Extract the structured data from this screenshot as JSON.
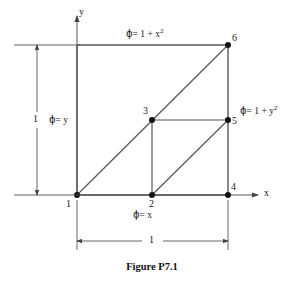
{
  "figure": {
    "caption": "Figure P7.1",
    "axes": {
      "x_label": "x",
      "y_label": "y"
    },
    "nodes": [
      {
        "id": "1",
        "label": "1",
        "x": 0.0,
        "y": 0.0
      },
      {
        "id": "2",
        "label": "2",
        "x": 0.5,
        "y": 0.0
      },
      {
        "id": "3",
        "label": "3",
        "x": 0.5,
        "y": 0.5
      },
      {
        "id": "4",
        "label": "4",
        "x": 1.0,
        "y": 0.0
      },
      {
        "id": "5",
        "label": "5",
        "x": 1.0,
        "y": 0.5
      },
      {
        "id": "6",
        "label": "6",
        "x": 1.0,
        "y": 1.0
      }
    ],
    "boundary_conditions": [
      {
        "name": "top",
        "glyph": "ϕ",
        "equation": "= 1 + x",
        "exponent": "2",
        "full": "ϕ = 1 + x²"
      },
      {
        "name": "right",
        "glyph": "ϕ",
        "equation": "= 1 + y",
        "exponent": "2",
        "full": "ϕ = 1 + y²"
      },
      {
        "name": "left",
        "glyph": "ϕ",
        "equation": "= y",
        "exponent": "",
        "full": "ϕ = y"
      },
      {
        "name": "bottom",
        "glyph": "ϕ",
        "equation": "= x",
        "exponent": "",
        "full": "ϕ = x"
      }
    ],
    "dimensions": [
      {
        "name": "vertical",
        "label": "1"
      },
      {
        "name": "horizontal",
        "label": "1"
      }
    ],
    "colors": {
      "line": "#555555",
      "node": "#111111",
      "text": "#1a1a1a"
    }
  }
}
